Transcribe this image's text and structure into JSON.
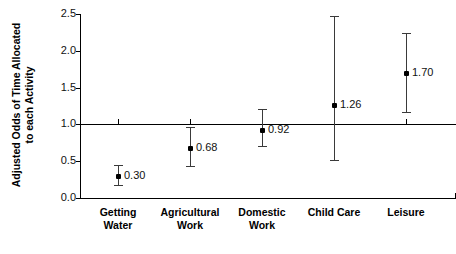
{
  "chart_data": {
    "type": "scatter",
    "title": "",
    "xlabel": "",
    "ylabel_line1": "Adjusted Odds of Time Allocated",
    "ylabel_line2": "to each Activity",
    "ylim": [
      0.0,
      2.5
    ],
    "yticks": [
      "0.0",
      "0.5",
      "1.0",
      "1.5",
      "2.0",
      "2.5"
    ],
    "ytick_values": [
      0.0,
      0.5,
      1.0,
      1.5,
      2.0,
      2.5
    ],
    "reference_line": 1.0,
    "grid": false,
    "legend": "none",
    "categories": [
      "Getting Water",
      "Agricultural Work",
      "Domestic Work",
      "Child Care",
      "Leisure"
    ],
    "category_lines": [
      [
        "Getting",
        "Water"
      ],
      [
        "Agricultural",
        "Work"
      ],
      [
        "Domestic",
        "Work"
      ],
      [
        "Child Care"
      ],
      [
        "Leisure"
      ]
    ],
    "values": [
      0.3,
      0.68,
      0.92,
      1.26,
      1.7
    ],
    "value_labels": [
      "0.30",
      "0.68",
      "0.92",
      "1.26",
      "1.70"
    ],
    "ci_low": [
      0.17,
      0.44,
      0.7,
      0.52,
      1.17
    ],
    "ci_high": [
      0.45,
      0.97,
      1.21,
      2.47,
      2.24
    ],
    "point_color": "#000000",
    "errorbar_color": "#3a3a3a",
    "axis_color": "#000000",
    "background": "#ffffff"
  }
}
